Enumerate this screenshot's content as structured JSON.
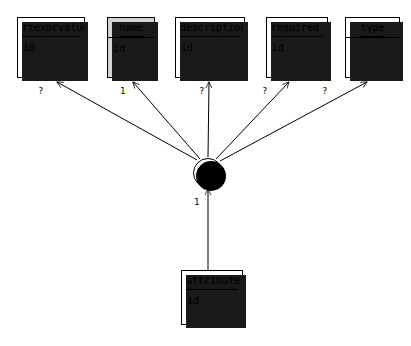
{
  "diagram": {
    "background_color": "#ffffff",
    "line_color": "#000000",
    "shaded_fill": "#d4d4d4",
    "shadow_color": "#1a1a1a",
    "field_label": "id",
    "operator_label": "AND",
    "nodes": [
      {
        "id": "rtexprvalue",
        "title": "rtexprvalue",
        "fields": [
          "id"
        ],
        "shaded": false,
        "title_align": "left",
        "x": 17,
        "y": 17,
        "width": 68,
        "height": 61
      },
      {
        "id": "name",
        "title": "name",
        "fields": [
          "id"
        ],
        "shaded": true,
        "title_align": "center",
        "x": 107,
        "y": 17,
        "width": 48,
        "height": 61
      },
      {
        "id": "description",
        "title": "description",
        "fields": [
          "id"
        ],
        "shaded": false,
        "title_align": "left",
        "x": 175,
        "y": 17,
        "width": 70,
        "height": 61
      },
      {
        "id": "required",
        "title": "required",
        "fields": [
          "id"
        ],
        "shaded": false,
        "title_align": "left",
        "x": 266,
        "y": 17,
        "width": 62,
        "height": 61
      },
      {
        "id": "type",
        "title": "type",
        "fields": [],
        "shaded": false,
        "title_align": "center",
        "x": 345,
        "y": 17,
        "width": 55,
        "height": 61
      },
      {
        "id": "attribute",
        "title": "attribute",
        "fields": [
          "id"
        ],
        "shaded": false,
        "title_align": "left",
        "x": 181,
        "y": 270,
        "width": 62,
        "height": 55
      }
    ],
    "operator": {
      "id": "and-node",
      "label": "AND",
      "cx": 208,
      "cy": 173,
      "r": 15
    },
    "edges": [
      {
        "from": "and-node",
        "to": "rtexprvalue",
        "label": "?",
        "label_x": 38,
        "label_y": 93
      },
      {
        "from": "and-node",
        "to": "name",
        "label": "1",
        "label_x": 120,
        "label_y": 93
      },
      {
        "from": "and-node",
        "to": "description",
        "label": "?",
        "label_x": 199,
        "label_y": 93
      },
      {
        "from": "and-node",
        "to": "required",
        "label": "?",
        "label_x": 262,
        "label_y": 93
      },
      {
        "from": "and-node",
        "to": "type",
        "label": "?",
        "label_x": 322,
        "label_y": 93
      },
      {
        "from": "attribute",
        "to": "and-node",
        "label": "1",
        "label_x": 194,
        "label_y": 204
      }
    ]
  }
}
